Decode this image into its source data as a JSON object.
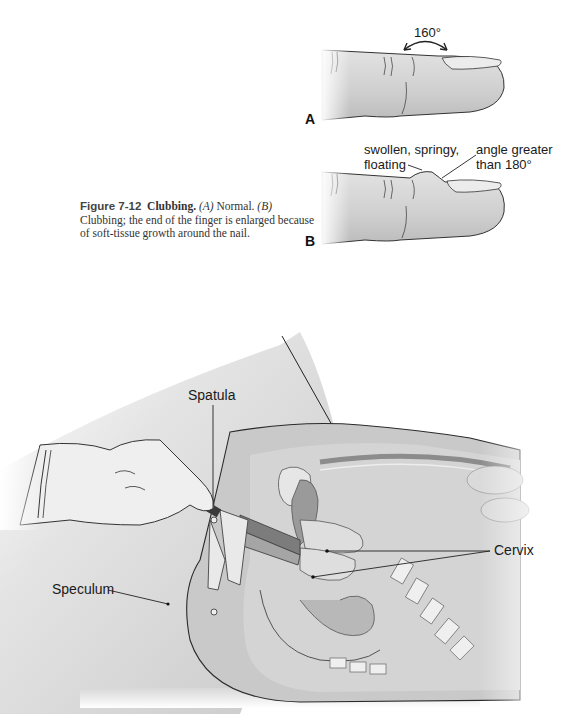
{
  "figure_top": {
    "panel_a": {
      "letter": "A",
      "angle_label": "160°"
    },
    "panel_b": {
      "letter": "B",
      "label_left_line1": "swollen, springy,",
      "label_left_line2": "floating",
      "label_right_line1": "angle greater",
      "label_right_line2": "than 180°"
    },
    "caption": {
      "figure_number": "Figure 7-12",
      "title": "Clubbing.",
      "a_marker": "(A)",
      "a_text": " Normal. ",
      "b_marker": "(B)",
      "b_text": " Clubbing; the end of the finger is enlarged because of soft-tissue growth around the nail."
    }
  },
  "figure_bottom": {
    "labels": {
      "spatula": "Spatula",
      "speculum": "Speculum",
      "cervix": "Cervix"
    }
  },
  "colors": {
    "skin": "#d6d6d6",
    "skin_dark": "#bdbdbd",
    "tissue": "#cfcfcf",
    "organ_dark": "#8f8f8f",
    "outline": "#2a2a2a"
  }
}
